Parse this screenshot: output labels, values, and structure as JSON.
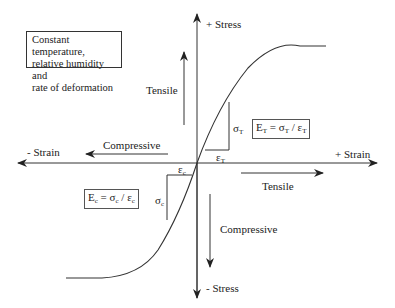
{
  "diagram": {
    "title_note": {
      "lines": [
        "Constant temperature,",
        "relative humidity and",
        "rate of deformation"
      ]
    },
    "axes": {
      "y_positive": "+ Stress",
      "y_negative": "- Stress",
      "x_positive": "+ Strain",
      "x_negative": "- Strain"
    },
    "direction_labels": {
      "tensile_vertical": "Tensile",
      "compressive_horizontal": "Compressive",
      "tensile_horizontal": "Tensile",
      "compressive_vertical": "Compressive"
    },
    "tension": {
      "stress_symbol": "σ",
      "stress_sub": "T",
      "strain_symbol": "ε",
      "strain_sub": "T",
      "equation": "E_T = σ_T / ε_T"
    },
    "compression": {
      "stress_symbol": "σ",
      "stress_sub": "c",
      "strain_symbol": "ε",
      "strain_sub": "c",
      "equation": "E_c = σ_c / ε_c"
    },
    "colors": {
      "line": "#222222",
      "background": "#ffffff"
    }
  }
}
